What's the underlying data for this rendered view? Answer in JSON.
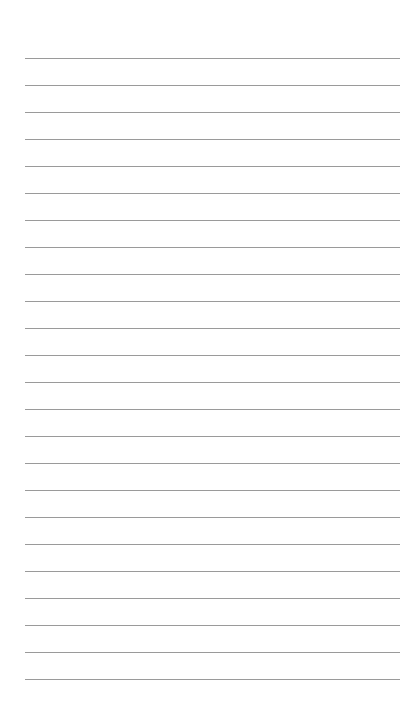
{
  "page": {
    "type": "lined-paper",
    "line_count": 24,
    "line_color": "#9a9a9a",
    "background": "#ffffff",
    "bleed_through_text": ""
  }
}
